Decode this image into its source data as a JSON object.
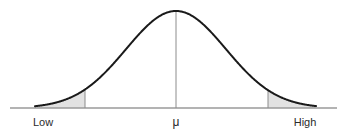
{
  "figure": {
    "name": "normal-distribution-curve",
    "width": 347,
    "height": 136,
    "background_color": "#ffffff",
    "curve_color": "#1a1a1a",
    "curve_width": 2,
    "axis_color": "#9a9a9a",
    "axis_width": 1.5,
    "divider_color": "#8c8c8c",
    "divider_width": 1,
    "tail_fill_color": "#e2e2e2",
    "center_line_color": "#8c8c8c"
  },
  "labels": {
    "low": "Low",
    "mu": "μ",
    "high": "High"
  },
  "chart_data": {
    "type": "line",
    "title": "",
    "xlabel": "",
    "ylabel": "",
    "subtitle": "",
    "legend": [],
    "grid": false,
    "curve": "normal (Gaussian) probability density",
    "mean_label": "μ",
    "x_tick_labels": [
      "Low",
      "μ",
      "High"
    ],
    "x_tick_positions_px": [
      43,
      176,
      305
    ],
    "baseline_y_px": 108,
    "peak_y_px": 11,
    "peak_x_px": 176,
    "curve_start_x_px": 35,
    "curve_end_x_px": 316,
    "axis_start_x_px": 10,
    "axis_end_x_px": 337,
    "sigma_px": 50,
    "shaded_regions": [
      {
        "name": "left-tail",
        "from_x_px": 35,
        "to_x_px": 85,
        "from_sigma": -2.82,
        "to_sigma": -1.82,
        "fill": "#e2e2e2",
        "boundary_line_x_px": 85
      },
      {
        "name": "right-tail",
        "from_x_px": 268,
        "to_x_px": 316,
        "from_sigma": 1.84,
        "to_sigma": 2.8,
        "fill": "#e2e2e2",
        "boundary_line_x_px": 268
      }
    ],
    "vertical_lines": [
      {
        "name": "left-cutoff",
        "x_px": 85,
        "top_y_px": 80,
        "bottom_y_px": 108
      },
      {
        "name": "center-mean",
        "x_px": 176,
        "top_y_px": 11,
        "bottom_y_px": 108
      },
      {
        "name": "right-cutoff",
        "x_px": 268,
        "top_y_px": 81,
        "bottom_y_px": 108
      }
    ]
  }
}
